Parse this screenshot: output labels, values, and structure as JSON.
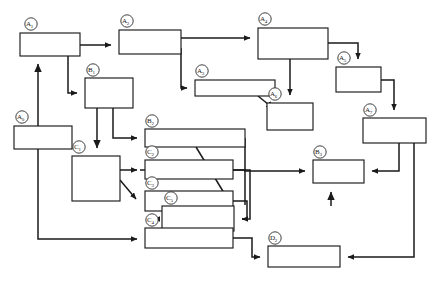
{
  "diagram": {
    "type": "block-flow-diagram",
    "title": "",
    "stroke_color": "#1a1a1a",
    "fill_color": "#ffffff",
    "background": "#ffffff",
    "nodes": [
      {
        "id": "A1",
        "label": "A",
        "sub": "1",
        "x": 20,
        "y": 33,
        "w": 60,
        "h": 23
      },
      {
        "id": "A2",
        "label": "A",
        "sub": "2",
        "x": 119,
        "y": 30,
        "w": 62,
        "h": 24
      },
      {
        "id": "A4",
        "label": "A",
        "sub": "4",
        "x": 258,
        "y": 28,
        "w": 70,
        "h": 31
      },
      {
        "id": "A5",
        "label": "A",
        "sub": "5",
        "x": 336,
        "y": 67,
        "w": 45,
        "h": 25
      },
      {
        "id": "B1",
        "label": "B",
        "sub": "1",
        "x": 85,
        "y": 78,
        "w": 48,
        "h": 30
      },
      {
        "id": "A3",
        "label": "A",
        "sub": "3",
        "x": 195,
        "y": 80,
        "w": 80,
        "h": 16
      },
      {
        "id": "A6",
        "label": "A",
        "sub": "6",
        "x": 267,
        "y": 103,
        "w": 46,
        "h": 27
      },
      {
        "id": "A7",
        "label": "A",
        "sub": "7",
        "x": 363,
        "y": 118,
        "w": 63,
        "h": 25
      },
      {
        "id": "A0",
        "label": "A",
        "sub": "0",
        "x": 14,
        "y": 126,
        "w": 58,
        "h": 23
      },
      {
        "id": "B2",
        "label": "B",
        "sub": "2",
        "x": 145,
        "y": 129,
        "w": 100,
        "h": 18
      },
      {
        "id": "C1",
        "label": "C",
        "sub": "1",
        "x": 72,
        "y": 156,
        "w": 48,
        "h": 45
      },
      {
        "id": "C2",
        "label": "C",
        "sub": "2",
        "x": 145,
        "y": 160,
        "w": 88,
        "h": 19
      },
      {
        "id": "B3",
        "label": "B",
        "sub": "3",
        "x": 313,
        "y": 160,
        "w": 51,
        "h": 23
      },
      {
        "id": "C3",
        "label": "C",
        "sub": "3",
        "x": 145,
        "y": 191,
        "w": 88,
        "h": 20
      },
      {
        "id": "C5",
        "label": "C",
        "sub": "5",
        "x": 162,
        "y": 206,
        "w": 72,
        "h": 25
      },
      {
        "id": "C4",
        "label": "C",
        "sub": "4",
        "x": 145,
        "y": 228,
        "w": 88,
        "h": 20
      },
      {
        "id": "D2",
        "label": "D",
        "sub": "2",
        "x": 268,
        "y": 246,
        "w": 72,
        "h": 21
      }
    ],
    "edges": [
      {
        "from": "A1",
        "to": "A2",
        "kind": "arrow"
      },
      {
        "from": "A2",
        "to": "A4",
        "kind": "arrow"
      },
      {
        "from": "A1",
        "to": "B1",
        "kind": "arrow"
      },
      {
        "from": "A2",
        "to": "A3",
        "kind": "arrow"
      },
      {
        "from": "A4",
        "to": "A5",
        "kind": "arrow"
      },
      {
        "from": "A4",
        "to": "A6",
        "kind": "arrow"
      },
      {
        "from": "A3",
        "to": "A6",
        "kind": "arrow"
      },
      {
        "from": "A5",
        "to": "A7",
        "kind": "arrow"
      },
      {
        "from": "A0",
        "to": "A1",
        "kind": "arrow"
      },
      {
        "from": "B1",
        "to": "C1",
        "kind": "arrow"
      },
      {
        "from": "B1",
        "to": "B2",
        "kind": "arrow"
      },
      {
        "from": "C1",
        "to": "C2",
        "kind": "arrow"
      },
      {
        "from": "C1",
        "to": "C3",
        "kind": "arrow"
      },
      {
        "from": "A0",
        "to": "C4",
        "kind": "arrow"
      },
      {
        "from": "B2",
        "to": "B3",
        "kind": "arrow"
      },
      {
        "from": "C2",
        "to": "C5",
        "kind": "arrow"
      },
      {
        "from": "C3",
        "to": "C5",
        "kind": "arrow"
      },
      {
        "from": "C4",
        "to": "D2",
        "kind": "arrow"
      },
      {
        "from": "C5",
        "to": "B3",
        "kind": "arrow"
      },
      {
        "from": "A7",
        "to": "B3",
        "kind": "arrow"
      },
      {
        "from": "A7",
        "to": "D2",
        "kind": "arrow"
      }
    ]
  }
}
